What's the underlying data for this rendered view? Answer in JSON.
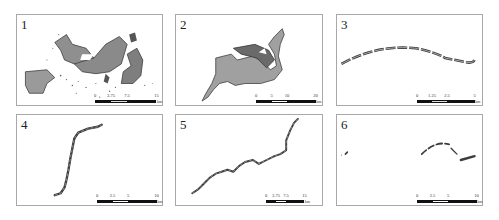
{
  "figure": {
    "panels": [
      {
        "id": "1",
        "label": "1",
        "scale": {
          "ticks": [
            "0",
            "3.75",
            "7.5",
            "15"
          ],
          "unit": "km"
        },
        "description": "large irregular mixed patch area"
      },
      {
        "id": "2",
        "label": "2",
        "scale": {
          "ticks": [
            "0",
            "5",
            "10",
            "20"
          ],
          "unit": "km"
        },
        "description": "single large irregular polygon with tail"
      },
      {
        "id": "3",
        "label": "3",
        "scale": {
          "ticks": [
            "0",
            "1.25",
            "2.5",
            "5"
          ],
          "unit": "km"
        },
        "description": "thin arched linear segmented strip"
      },
      {
        "id": "4",
        "label": "4",
        "scale": {
          "ticks": [
            "0",
            "2.5",
            "5",
            "10"
          ],
          "unit": "km"
        },
        "description": "narrow vertical linear corridor"
      },
      {
        "id": "5",
        "label": "5",
        "scale": {
          "ticks": [
            "0",
            "3.75",
            "7.5",
            "15"
          ],
          "unit": "km"
        },
        "description": "meandering diagonal linear corridor"
      },
      {
        "id": "6",
        "label": "6",
        "scale": {
          "ticks": [
            "0",
            "2.5",
            "5",
            "10"
          ],
          "unit": "km"
        },
        "description": "sparse fragmented arc segments"
      }
    ]
  },
  "colors": {
    "fill": "#9a9a9a",
    "dark": "#3c3c3c",
    "border": "#a8a8a8"
  }
}
